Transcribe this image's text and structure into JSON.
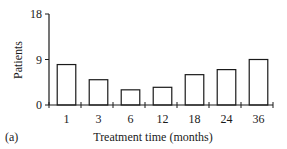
{
  "chart_data": {
    "type": "bar",
    "title": "",
    "panel_label": "(a)",
    "xlabel": "Treatment time (months)",
    "ylabel": "Patients",
    "categories": [
      "1",
      "3",
      "6",
      "12",
      "18",
      "24",
      "36"
    ],
    "values": [
      8,
      5,
      3,
      3.5,
      6,
      7,
      9
    ],
    "ylim": [
      0,
      18
    ],
    "yticks": [
      0,
      9,
      18
    ],
    "grid": false,
    "legend": null,
    "bar_fill": "#ffffff",
    "bar_stroke": "#1a1a1a"
  }
}
